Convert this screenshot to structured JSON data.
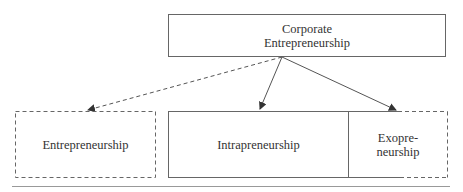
{
  "diagram": {
    "top_node": {
      "label_line1": "Corporate",
      "label_line2": "Entrepreneurship"
    },
    "nodes": [
      {
        "id": "entrepreneurship",
        "label": "Entrepreneurship",
        "border": "dashed"
      },
      {
        "id": "intrapreneurship",
        "label": "Intrapreneurship",
        "border": "solid"
      },
      {
        "id": "exopreneurship",
        "label_line1": "Exopre-",
        "label_line2": "neurship",
        "border": "partially-dashed"
      }
    ],
    "edges": [
      {
        "from": "corporate-entrepreneurship",
        "to": "entrepreneurship",
        "style": "dashed"
      },
      {
        "from": "corporate-entrepreneurship",
        "to": "intrapreneurship",
        "style": "solid"
      },
      {
        "from": "corporate-entrepreneurship",
        "to": "exopreneurship",
        "style": "solid"
      }
    ],
    "colors": {
      "line": "#555555",
      "text": "#333333"
    }
  }
}
